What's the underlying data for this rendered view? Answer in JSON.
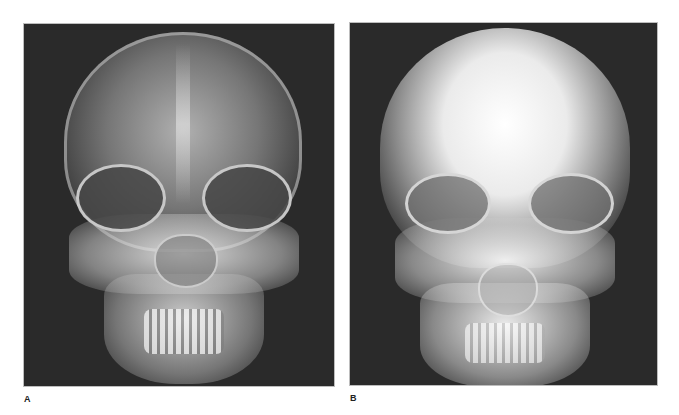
{
  "figure": {
    "panels": [
      {
        "label": "A",
        "description": "Frontal (PA) skull radiograph with normal exposure showing cranial vault, orbits, maxillary region, mandible and teeth",
        "background_color": "#2a2a2a"
      },
      {
        "label": "B",
        "description": "Frontal (PA) skull radiograph with overexposed bright cranial vault, orbits, maxilla, mandible and teeth",
        "background_color": "#2a2a2a"
      }
    ]
  }
}
